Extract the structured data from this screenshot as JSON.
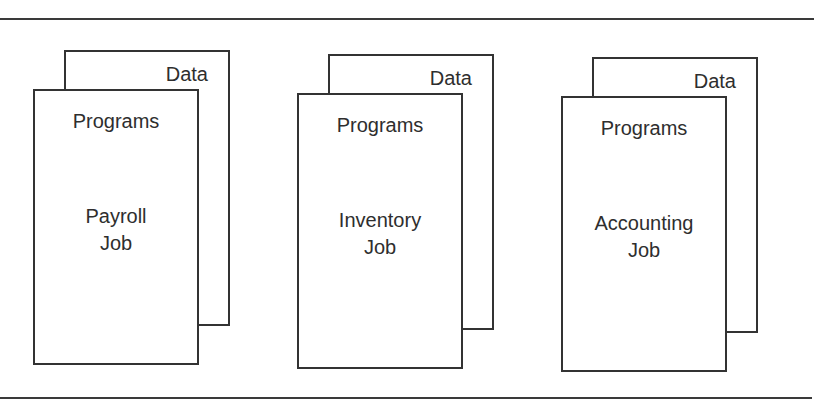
{
  "diagram": {
    "groups": [
      {
        "id": "payroll",
        "back_page_label": "Data",
        "front_page_label": "Programs",
        "job_name_line1": "Payroll",
        "job_name_line2": "Job"
      },
      {
        "id": "inventory",
        "back_page_label": "Data",
        "front_page_label": "Programs",
        "job_name_line1": "Inventory",
        "job_name_line2": "Job"
      },
      {
        "id": "accounting",
        "back_page_label": "Data",
        "front_page_label": "Programs",
        "job_name_line1": "Accounting",
        "job_name_line2": "Job"
      }
    ]
  }
}
